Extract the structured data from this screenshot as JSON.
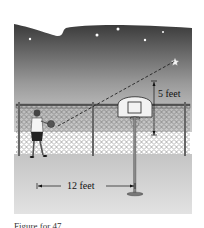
{
  "figure": {
    "labels": {
      "height_label": "5 feet",
      "distance_label": "12 feet"
    },
    "caption": "Figure for 47",
    "elements": {
      "sky": "night sky with stars",
      "hoop": "basketball hoop with backboard",
      "fence": "chain-link fence",
      "person": "person holding basketball",
      "sight_line": "dashed line from person to star"
    },
    "colors": {
      "sky_top": "#3a3a3a",
      "sky_bottom": "#d6d6d6",
      "ground": "#cfcfcf",
      "ink": "#111111"
    }
  }
}
